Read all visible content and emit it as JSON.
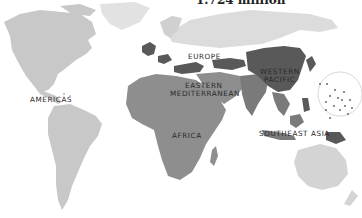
{
  "map": {
    "title": "1.724 million",
    "regions": [
      {
        "key": "americas",
        "label": "AMERICAS",
        "shade": "light"
      },
      {
        "key": "europe",
        "label": "EUROPE",
        "shade": "dark"
      },
      {
        "key": "eastern_mediterranean_1",
        "label": "EASTERN",
        "shade": "medium"
      },
      {
        "key": "eastern_mediterranean_2",
        "label": "MEDITERRANEAN",
        "shade": "medium"
      },
      {
        "key": "africa",
        "label": "AFRICA",
        "shade": "medium"
      },
      {
        "key": "western_pacific_1",
        "label": "WESTERN",
        "shade": "dark"
      },
      {
        "key": "western_pacific_2",
        "label": "PACIFIC",
        "shade": "dark"
      },
      {
        "key": "southeast_asia",
        "label": "SOUTHEAST ASIA",
        "shade": "medium-dark"
      }
    ],
    "colors": {
      "background": "#ffffff",
      "light": "#c8c8c8",
      "very_light": "#e2e2e2",
      "medium": "#8e8e8e",
      "medium_dark": "#7a7a7a",
      "dark": "#595959",
      "border": "#d8d8d8"
    }
  }
}
